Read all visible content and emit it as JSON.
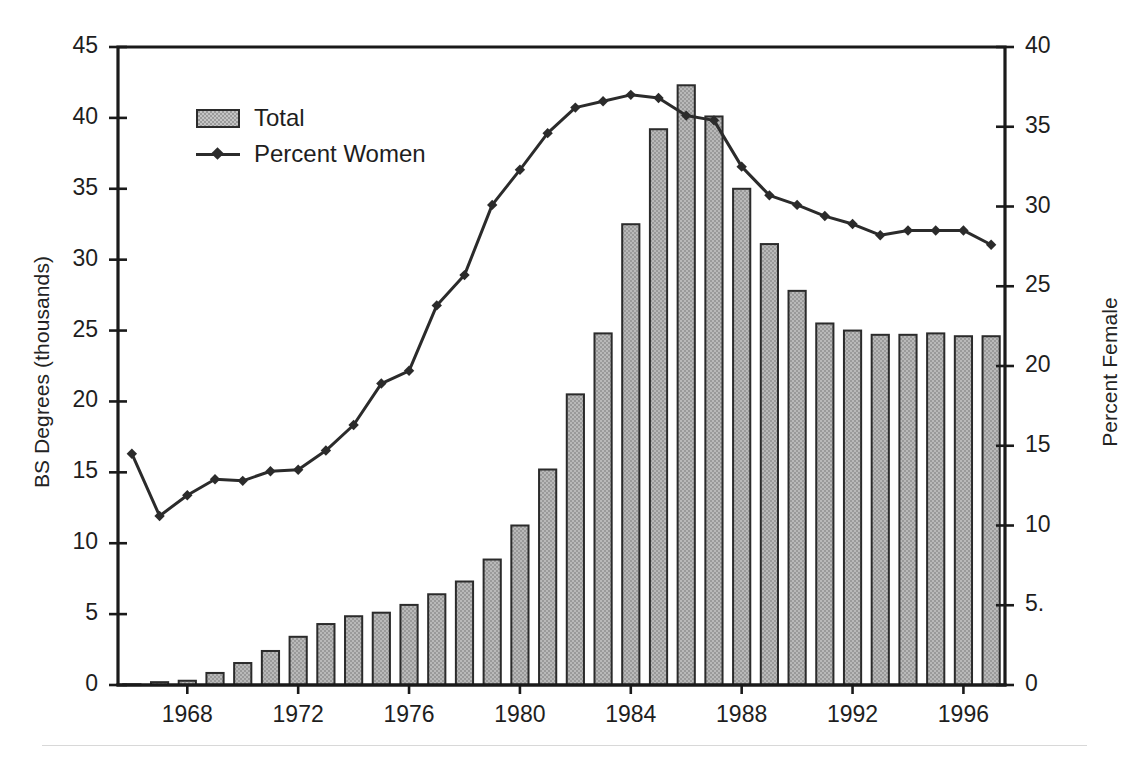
{
  "chart_data": {
    "type": "bar",
    "title": "",
    "subtitle": "",
    "xlabel": "",
    "ylabel": "BS Degrees (thousands)",
    "y2label": "Percent Female",
    "grid": false,
    "legend_position": "upper-left",
    "xlim": [
      1965.5,
      1997.5
    ],
    "ylim": [
      0,
      45
    ],
    "y2lim": [
      0,
      40
    ],
    "x_tick_labels": [
      "1968",
      "1972",
      "1976",
      "1980",
      "1984",
      "1988",
      "1992",
      "1996"
    ],
    "x_tick_values": [
      1968,
      1972,
      1976,
      1980,
      1984,
      1988,
      1992,
      1996
    ],
    "y_tick_labels": [
      "0",
      "5",
      "10",
      "15",
      "20",
      "25",
      "30",
      "35",
      "40",
      "45"
    ],
    "y_tick_values": [
      0,
      5,
      10,
      15,
      20,
      25,
      30,
      35,
      40,
      45
    ],
    "y2_tick_labels": [
      "0",
      "5.",
      "10",
      "15",
      "20",
      "25",
      "30",
      "35",
      "40"
    ],
    "y2_tick_values": [
      0,
      5,
      10,
      15,
      20,
      25,
      30,
      35,
      40
    ],
    "categories": [
      1966,
      1967,
      1968,
      1969,
      1970,
      1971,
      1972,
      1973,
      1974,
      1975,
      1976,
      1977,
      1978,
      1979,
      1980,
      1981,
      1982,
      1983,
      1984,
      1985,
      1986,
      1987,
      1988,
      1989,
      1990,
      1991,
      1992,
      1993,
      1994,
      1995,
      1996,
      1997
    ],
    "series": [
      {
        "name": "Total",
        "type": "bar",
        "axis": "left",
        "units": "thousands of BS degrees",
        "color": "#9a9a9a",
        "edge_color": "#2b2b2b",
        "values": [
          0.05,
          0.2,
          0.3,
          0.85,
          1.55,
          2.4,
          3.4,
          4.3,
          4.85,
          5.1,
          5.65,
          6.4,
          7.3,
          8.85,
          11.25,
          15.2,
          20.5,
          24.8,
          32.5,
          39.2,
          42.3,
          40.1,
          35.0,
          31.1,
          27.8,
          25.5,
          25.0,
          24.7,
          24.7,
          24.8,
          24.6,
          24.6
        ]
      },
      {
        "name": "Percent Women",
        "type": "line",
        "axis": "right",
        "units": "percent female",
        "color": "#2b2b2b",
        "marker": "diamond",
        "values": [
          14.5,
          10.6,
          11.9,
          12.9,
          12.8,
          13.4,
          13.5,
          14.7,
          16.3,
          18.9,
          19.7,
          23.8,
          25.7,
          30.1,
          32.3,
          34.6,
          36.2,
          36.6,
          37.0,
          36.8,
          35.7,
          35.4,
          32.5,
          30.7,
          30.1,
          29.4,
          28.9,
          28.2,
          28.5,
          28.5,
          28.5,
          27.6
        ]
      }
    ],
    "legend": [
      {
        "label": "Total",
        "swatch": "bar-swatch"
      },
      {
        "label": "Percent Women",
        "swatch": "line-marker-swatch"
      }
    ]
  }
}
